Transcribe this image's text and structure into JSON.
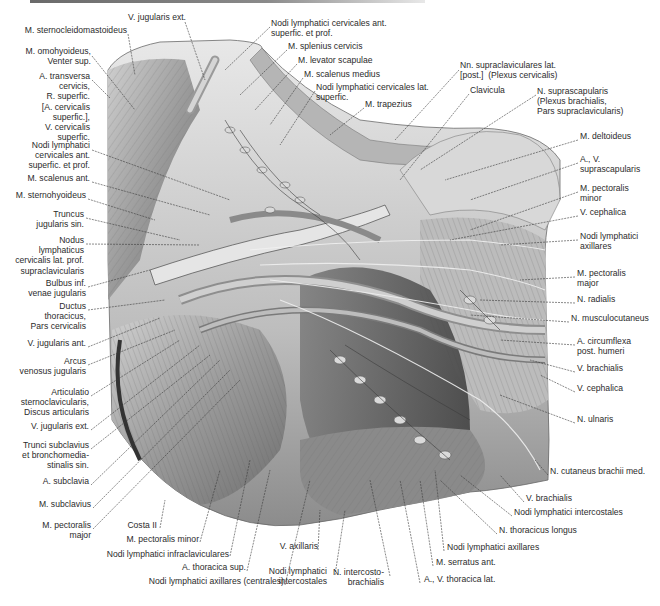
{
  "figure": {
    "kind": "anatomical illustration",
    "region": "left neck, supraclavicular and axillary region (lymphatics)"
  },
  "labels": {
    "left": [
      {
        "id": "v_jugularis_ext_top",
        "text": "V. jugularis ext.",
        "x": 186,
        "y": 17
      },
      {
        "id": "m_sternocleidomastoideus",
        "text": "M. sternocleidomastoideus",
        "x": 127,
        "y": 30
      },
      {
        "id": "m_omohyoideus",
        "text": "M. omohyoideus,\nVenter sup.",
        "x": 91,
        "y": 51
      },
      {
        "id": "a_transversa_cervicis",
        "text": "A. transversa\ncervicis,\nR. superfic.\n[A. cervicalis\nsuperfic.],\nV. cervicalis\nsuperfic.",
        "x": 90,
        "y": 76
      },
      {
        "id": "nodi_cervicales_ant_left",
        "text": "Nodi lymphatici\ncervicales ant.\nsuperfic. et prof.",
        "x": 90,
        "y": 145
      },
      {
        "id": "m_scalenus_ant",
        "text": "M. scalenus ant.",
        "x": 90,
        "y": 178
      },
      {
        "id": "m_sternohyoideus",
        "text": "M. sternohyoideus",
        "x": 86,
        "y": 195
      },
      {
        "id": "truncus_jugularis",
        "text": "Truncus\njugularis sin.",
        "x": 84,
        "y": 214
      },
      {
        "id": "nodus_supraclavicularis",
        "text": "Nodus\nlymphaticus\ncervicalis lat. prof.\nsupraclavicularis",
        "x": 84,
        "y": 240
      },
      {
        "id": "bulbus_inf",
        "text": "Bulbus inf.\nvenae jugularis",
        "x": 86,
        "y": 283
      },
      {
        "id": "ductus_thoracicus",
        "text": "Ductus\nthoracicus,\nPars cervicalis",
        "x": 86,
        "y": 306
      },
      {
        "id": "v_jugularis_ant",
        "text": "V. jugularis ant.",
        "x": 86,
        "y": 343
      },
      {
        "id": "arcus_venosus",
        "text": "Arcus\nvenosus jugularis",
        "x": 86,
        "y": 361
      },
      {
        "id": "articulatio_sternoclavicularis",
        "text": "Articulatio\nsternoclavicularis,\nDiscus articularis",
        "x": 89,
        "y": 392
      },
      {
        "id": "v_jugularis_ext_bottom",
        "text": "V. jugularis ext.",
        "x": 89,
        "y": 426
      },
      {
        "id": "trunci_subclavius",
        "text": "Trunci subclavius\net bronchomedia-\nstinalis sin.",
        "x": 89,
        "y": 445
      },
      {
        "id": "a_subclavia",
        "text": "A. subclavia",
        "x": 89,
        "y": 481
      },
      {
        "id": "m_subclavius",
        "text": "M. subclavius",
        "x": 91,
        "y": 504
      },
      {
        "id": "m_pectoralis_major_left",
        "text": "M. pectoralis\nmajor",
        "x": 91,
        "y": 525
      }
    ],
    "top": [
      {
        "id": "nodi_cervicales_ant_top",
        "text": "Nodi lymphatici cervicales ant.\nsuperfic. et prof.",
        "x": 271,
        "y": 23
      },
      {
        "id": "m_splenius_cervicis",
        "text": "M. splenius cervicis",
        "x": 288,
        "y": 46
      },
      {
        "id": "m_levator_scapulae",
        "text": "M. levator scapulae",
        "x": 298,
        "y": 60
      },
      {
        "id": "m_scalenus_medius",
        "text": "M. scalenus medius",
        "x": 304,
        "y": 74
      },
      {
        "id": "nodi_cervicales_lat",
        "text": "Nodi lymphatici cervicales lat.\nsuperfic.",
        "x": 316,
        "y": 87
      },
      {
        "id": "m_trapezius",
        "text": "M. trapezius",
        "x": 365,
        "y": 104
      },
      {
        "id": "nn_supraclaviculares",
        "text": "Nn. supraclaviculares lat.\n[post.]  (Plexus cervicalis)",
        "x": 460,
        "y": 65
      },
      {
        "id": "clavicula",
        "text": "Clavicula",
        "x": 470,
        "y": 90
      },
      {
        "id": "n_suprascapularis",
        "text": "N. suprascapularis\n(Plexus brachialis,\nPars supraclavicularis)",
        "x": 537,
        "y": 91
      }
    ],
    "right": [
      {
        "id": "m_deltoideus",
        "text": "M. deltoideus",
        "x": 580,
        "y": 136
      },
      {
        "id": "av_suprascapularis",
        "text": "A., V.\nsuprascapularis",
        "x": 580,
        "y": 159
      },
      {
        "id": "m_pectoralis_minor_right",
        "text": "M. pectoralis\nminor",
        "x": 580,
        "y": 188
      },
      {
        "id": "v_cephalica_top",
        "text": "V. cephalica",
        "x": 580,
        "y": 212
      },
      {
        "id": "nodi_axillares_right",
        "text": "Nodi lymphatici\naxillares",
        "x": 580,
        "y": 236
      },
      {
        "id": "m_pectoralis_major_right",
        "text": "M. pectoralis\nmajor",
        "x": 577,
        "y": 273
      },
      {
        "id": "n_radialis",
        "text": "N. radialis",
        "x": 577,
        "y": 299
      },
      {
        "id": "n_musculocutaneus",
        "text": "N. musculocutaneus",
        "x": 571,
        "y": 318
      },
      {
        "id": "a_circumflexa",
        "text": "A. circumflexa\npost. humeri",
        "x": 577,
        "y": 341
      },
      {
        "id": "v_brachialis_right",
        "text": "V. brachialis",
        "x": 577,
        "y": 368
      },
      {
        "id": "v_cephalica_bottom",
        "text": "V. cephalica",
        "x": 577,
        "y": 388
      },
      {
        "id": "n_ulnaris",
        "text": "N. ulnaris",
        "x": 577,
        "y": 419
      },
      {
        "id": "n_cutaneus_brachii",
        "text": "N. cutaneus brachii med.",
        "x": 550,
        "y": 471
      }
    ],
    "bottom": [
      {
        "id": "costa_ii",
        "text": "Costa II",
        "x": 123,
        "y": 525
      },
      {
        "id": "m_pectoralis_minor_bottom",
        "text": "M. pectoralis minor",
        "x": 112,
        "y": 539
      },
      {
        "id": "nodi_infraclaviculares",
        "text": "Nodi lymphatici infraclaviculares",
        "x": 85,
        "y": 554
      },
      {
        "id": "a_thoracica_sup",
        "text": "A. thoracica sup.",
        "x": 165,
        "y": 567
      },
      {
        "id": "nodi_axillares_centrales",
        "text": "Nodi lymphatici axillares (centrales)",
        "x": 124,
        "y": 581
      },
      {
        "id": "v_axillaris",
        "text": "V. axillaris",
        "x": 278,
        "y": 546
      },
      {
        "id": "nodi_intercostales_bottom",
        "text": "Nodi lymphatici\nintercostales",
        "x": 272,
        "y": 571
      },
      {
        "id": "n_intercostobrachialis",
        "text": "N. intercosto-\nbrachialis",
        "x": 342,
        "y": 572
      },
      {
        "id": "a_v_thoracica_lat",
        "text": "A., V. thoracica lat.",
        "x": 424,
        "y": 579
      },
      {
        "id": "m_serratus_ant",
        "text": "M. serratus ant.",
        "x": 436,
        "y": 562
      },
      {
        "id": "nodi_axillares_bottom",
        "text": "Nodi lymphatici axillares",
        "x": 447,
        "y": 547
      },
      {
        "id": "n_thoracicus_longus",
        "text": "N. thoracicus longus",
        "x": 499,
        "y": 530
      },
      {
        "id": "nodi_intercostales_right",
        "text": "Nodi lymphatici intercostales",
        "x": 514,
        "y": 512
      },
      {
        "id": "v_brachialis_bottom",
        "text": "V. brachialis",
        "x": 526,
        "y": 498
      }
    ]
  },
  "colors": {
    "background": "#ffffff",
    "tissue_light": "#d9d9d9",
    "tissue_mid": "#a8a8a8",
    "tissue_dark": "#5a5a5a",
    "leader_line": "#3a3a3a",
    "text": "#2b2b2b"
  }
}
